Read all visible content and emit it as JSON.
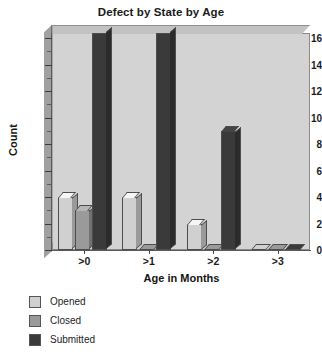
{
  "chart_data": {
    "type": "bar",
    "title": "Defect by State by Age",
    "xlabel": "Age in Months",
    "ylabel": "Count",
    "categories": [
      ">0",
      ">1",
      ">2",
      ">3"
    ],
    "series": [
      {
        "name": "Opened",
        "color": "#d0d0d0",
        "values": [
          4,
          4,
          2,
          0
        ]
      },
      {
        "name": "Closed",
        "color": "#9a9a9a",
        "values": [
          3,
          0,
          0,
          0
        ]
      },
      {
        "name": "Submitted",
        "color": "#3a3a3a",
        "values": [
          17,
          17,
          9,
          0
        ]
      }
    ],
    "ylim": [
      0,
      16
    ],
    "y_major_ticks": [
      0,
      2,
      4,
      6,
      8,
      10,
      12,
      14,
      16
    ],
    "y_minor_ticks": [
      1,
      3,
      5,
      7,
      9,
      11,
      13,
      15
    ],
    "y_tick_labels": [
      "0",
      "2",
      "4",
      "6",
      "8",
      "10",
      "12",
      "14",
      "16"
    ],
    "grid": false,
    "legend_position": "below-left",
    "plot_background": "#d3d3d3",
    "style_3d": true
  },
  "legend": {
    "entries": [
      {
        "label": "Opened"
      },
      {
        "label": "Closed"
      },
      {
        "label": "Submitted"
      }
    ]
  }
}
